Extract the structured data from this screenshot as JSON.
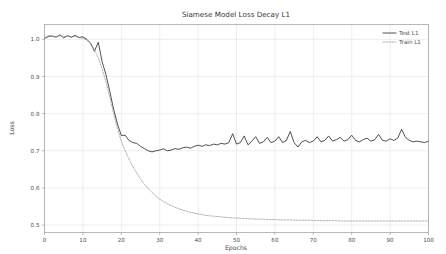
{
  "chart_data": {
    "type": "line",
    "title": "Siamese Model Loss Decay L1",
    "xlabel": "Epochs",
    "ylabel": "Loss",
    "xlim": [
      0,
      100
    ],
    "ylim": [
      0.48,
      1.04
    ],
    "grid": true,
    "legend_position": "upper right",
    "xticks": [
      0,
      10,
      20,
      30,
      40,
      50,
      60,
      70,
      80,
      90,
      100
    ],
    "xtick_labels": [
      "0",
      "10",
      "20",
      "30",
      "40",
      "50",
      "60",
      "70",
      "80",
      "90",
      "100"
    ],
    "yticks": [
      0.5,
      0.6,
      0.7,
      0.8,
      0.9,
      1.0
    ],
    "ytick_labels": [
      "0.5",
      "0.6",
      "0.7",
      "0.8",
      "0.9",
      "1.0"
    ],
    "x": [
      0,
      1,
      2,
      3,
      4,
      5,
      6,
      7,
      8,
      9,
      10,
      11,
      12,
      13,
      14,
      15,
      16,
      17,
      18,
      19,
      20,
      21,
      22,
      23,
      24,
      25,
      26,
      27,
      28,
      29,
      30,
      31,
      32,
      33,
      34,
      35,
      36,
      37,
      38,
      39,
      40,
      41,
      42,
      43,
      44,
      45,
      46,
      47,
      48,
      49,
      50,
      51,
      52,
      53,
      54,
      55,
      56,
      57,
      58,
      59,
      60,
      61,
      62,
      63,
      64,
      65,
      66,
      67,
      68,
      69,
      70,
      71,
      72,
      73,
      74,
      75,
      76,
      77,
      78,
      79,
      80,
      81,
      82,
      83,
      84,
      85,
      86,
      87,
      88,
      89,
      90,
      91,
      92,
      93,
      94,
      95,
      96,
      97,
      98,
      99,
      100
    ],
    "series": [
      {
        "name": "Test L1",
        "style": "solid",
        "color": "#3c3c3c",
        "values": [
          1.002,
          1.008,
          1.009,
          1.006,
          1.012,
          1.004,
          1.01,
          1.006,
          1.011,
          1.005,
          1.007,
          1.0,
          0.99,
          0.968,
          0.992,
          0.94,
          0.905,
          0.86,
          0.812,
          0.772,
          0.741,
          0.742,
          0.728,
          0.722,
          0.72,
          0.712,
          0.706,
          0.7,
          0.697,
          0.7,
          0.702,
          0.705,
          0.7,
          0.702,
          0.706,
          0.704,
          0.708,
          0.71,
          0.707,
          0.712,
          0.715,
          0.712,
          0.716,
          0.714,
          0.718,
          0.716,
          0.72,
          0.718,
          0.722,
          0.746,
          0.718,
          0.722,
          0.74,
          0.716,
          0.726,
          0.738,
          0.72,
          0.724,
          0.736,
          0.722,
          0.726,
          0.738,
          0.722,
          0.728,
          0.752,
          0.722,
          0.71,
          0.724,
          0.728,
          0.722,
          0.726,
          0.738,
          0.724,
          0.728,
          0.74,
          0.726,
          0.73,
          0.736,
          0.726,
          0.73,
          0.742,
          0.728,
          0.724,
          0.73,
          0.734,
          0.726,
          0.73,
          0.744,
          0.728,
          0.726,
          0.732,
          0.728,
          0.734,
          0.758,
          0.736,
          0.728,
          0.724,
          0.726,
          0.724,
          0.722,
          0.726
        ]
      },
      {
        "name": "Train L1",
        "style": "dashed",
        "color": "#8e8e8e",
        "values": [
          1.004,
          1.01,
          1.008,
          1.006,
          1.01,
          1.007,
          1.009,
          1.006,
          1.008,
          1.004,
          1.003,
          0.998,
          0.988,
          0.972,
          0.95,
          0.92,
          0.886,
          0.845,
          0.8,
          0.76,
          0.726,
          0.7,
          0.678,
          0.658,
          0.64,
          0.624,
          0.61,
          0.598,
          0.588,
          0.578,
          0.57,
          0.563,
          0.557,
          0.552,
          0.548,
          0.544,
          0.54,
          0.537,
          0.534,
          0.532,
          0.53,
          0.528,
          0.526,
          0.525,
          0.524,
          0.523,
          0.522,
          0.521,
          0.52,
          0.519,
          0.519,
          0.518,
          0.518,
          0.517,
          0.517,
          0.516,
          0.516,
          0.516,
          0.515,
          0.515,
          0.515,
          0.514,
          0.514,
          0.514,
          0.514,
          0.513,
          0.513,
          0.513,
          0.513,
          0.513,
          0.512,
          0.512,
          0.512,
          0.512,
          0.512,
          0.512,
          0.512,
          0.511,
          0.511,
          0.511,
          0.511,
          0.511,
          0.511,
          0.511,
          0.511,
          0.511,
          0.511,
          0.511,
          0.511,
          0.511,
          0.511,
          0.511,
          0.511,
          0.511,
          0.511,
          0.511,
          0.511,
          0.511,
          0.511,
          0.511,
          0.511
        ]
      }
    ]
  }
}
